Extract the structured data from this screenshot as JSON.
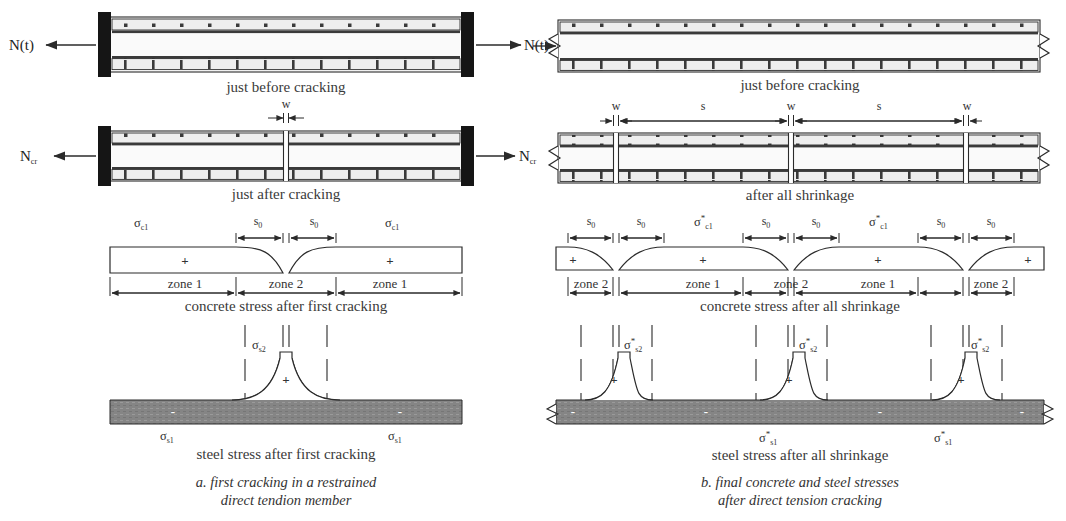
{
  "figure": {
    "title_visible": false,
    "colors": {
      "line": "#2b2b2b",
      "support_fill": "#1a1a1a",
      "steel_gray": "#808080",
      "concrete_fill": "#f7f7f7",
      "rebar_fill": "#e8e8e8",
      "background": "#ffffff"
    }
  },
  "panel_a": {
    "caption_line1": "a. first cracking in a restrained",
    "caption_line2": "direct tendion member",
    "stage1": {
      "label": "just before cracking",
      "force_left": "N(t)",
      "force_right": "N(t)",
      "support": "fixed-support"
    },
    "stage2": {
      "label": "just after cracking",
      "force_left": "N",
      "force_left_sub": "cr",
      "force_right": "N",
      "force_right_sub": "cr",
      "crack_width_label": "w"
    },
    "concrete_stress": {
      "label": "concrete stress after first cracking",
      "stress_symbol": "σ",
      "stress_sub": "c1",
      "sign": "+",
      "dim_label": "s",
      "dim_sub": "0",
      "zones": [
        "zone 1",
        "zone 2",
        "zone 1"
      ]
    },
    "steel_stress": {
      "label": "steel stress after first cracking",
      "peak_symbol": "σ",
      "peak_sub": "s2",
      "base_symbol": "σ",
      "base_sub": "s1",
      "sign_peak": "+",
      "sign_base": "-",
      "base_label_count": 2
    }
  },
  "panel_b": {
    "caption_line1": "b. final concrete and steel stresses",
    "caption_line2": "after direct tension cracking",
    "stage1": {
      "label": "just before cracking",
      "break_symbol": "zigzag-break"
    },
    "stage2": {
      "label": "after all shrinkage",
      "dims": [
        "w",
        "s",
        "w",
        "s",
        "w"
      ]
    },
    "concrete_stress": {
      "label": "concrete stress after all shrinkage",
      "stress_symbol": "σ",
      "stress_sup": "*",
      "stress_sub": "c1",
      "stress_label_count": 2,
      "sign": "+",
      "dim_label": "s",
      "dim_sub": "0",
      "zones": [
        "zone 2",
        "zone 1",
        "zone 2",
        "zone 1",
        "zone 2"
      ]
    },
    "steel_stress": {
      "label": "steel stress after all shrinkage",
      "peak_symbol": "σ",
      "peak_sup": "*",
      "peak_sub": "s2",
      "base_symbol": "σ",
      "base_sup": "*",
      "base_sub": "s1",
      "sign_peak": "+",
      "sign_base": "-",
      "peak_count": 3,
      "base_label_count": 2
    }
  }
}
